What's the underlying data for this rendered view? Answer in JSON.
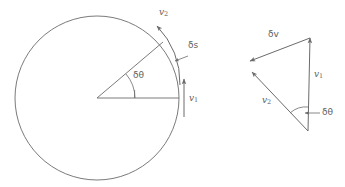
{
  "figure": {
    "stroke_color": "#6b6b6b",
    "label_color": "#5f5f5f",
    "background": "#ffffff"
  },
  "left_diagram": {
    "name": "circle-diagram",
    "circle": {
      "cx": 97,
      "cy": 98,
      "r": 82
    },
    "radius_horizontal": {
      "x1": 97,
      "y1": 98,
      "x2": 179,
      "y2": 98
    },
    "radius_angled": {
      "x1": 97,
      "y1": 98,
      "x2": 163,
      "y2": 42
    },
    "angle_degrees": 40,
    "labels": {
      "v1": "v",
      "v1_sub": "1",
      "v2": "v",
      "v2_sub": "2",
      "delta_s": "δs",
      "delta_theta": "δθ"
    }
  },
  "right_diagram": {
    "name": "vector-triangle-diagram",
    "vertices": {
      "bottom": {
        "x": 308,
        "y": 131
      },
      "top": {
        "x": 310,
        "y": 38
      },
      "left": {
        "x": 251,
        "y": 70
      }
    },
    "labels": {
      "v1": "v",
      "v1_sub": "1",
      "v2": "v",
      "v2_sub": "2",
      "delta_v": "δv",
      "delta_theta": "δθ"
    }
  }
}
